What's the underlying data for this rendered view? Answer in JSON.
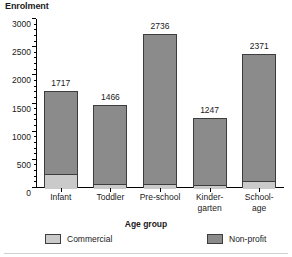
{
  "chart_data": {
    "type": "bar",
    "subtype": "stacked-vertical",
    "title": "",
    "ylabel": "Enrolment",
    "xlabel": "Age group",
    "categories": [
      "Infant",
      "Toddler",
      "Pre-school",
      "Kinder-\ngarten",
      "School-\nage"
    ],
    "category_lines": [
      [
        "Infant"
      ],
      [
        "Toddler"
      ],
      [
        "Pre-school"
      ],
      [
        "Kinder-",
        "garten"
      ],
      [
        "School-",
        "age"
      ]
    ],
    "series": [
      {
        "name": "Commercial",
        "color": "#cacaca",
        "values": [
          275,
          90,
          85,
          65,
          150
        ]
      },
      {
        "name": "Non-profit",
        "color": "#8b8b8b",
        "values": [
          1442,
          1376,
          2651,
          1182,
          2221
        ]
      }
    ],
    "totals": [
      1717,
      1466,
      2736,
      1247,
      2371
    ],
    "total_labels": [
      "1717",
      "1466",
      "2736",
      "1247",
      "2371"
    ],
    "ylim": [
      0,
      3000
    ],
    "ytick_values": [
      0,
      500,
      1000,
      1500,
      2000,
      2500,
      3000
    ],
    "ytick_labels": [
      "0",
      "500",
      "1000",
      "1500",
      "2000",
      "2500",
      "3000"
    ],
    "yminor_step": 100,
    "grid": false,
    "legend_position": "bottom"
  },
  "legend": {
    "commercial_label": "Commercial",
    "nonprofit_label": "Non-profit"
  }
}
